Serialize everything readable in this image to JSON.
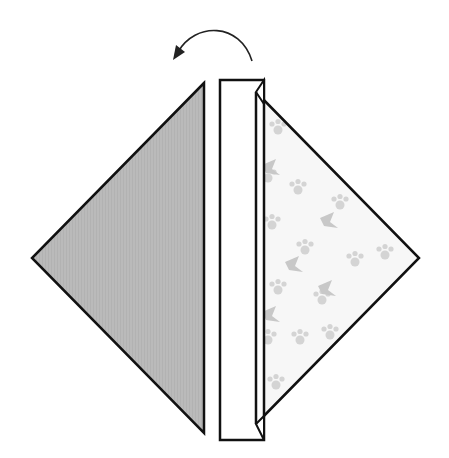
{
  "diagram": {
    "type": "origami-fold-step",
    "instruction": "Fold the right flap over to the left",
    "arrow": {
      "direction": "left",
      "icon": "curved-arrow-left-icon"
    },
    "colors": {
      "back_side": "#b9b9b9",
      "front_side": "#f6f6f6",
      "pattern": "#d6d6d6",
      "outline": "#111111"
    },
    "parts": [
      {
        "name": "left-gray-triangle",
        "label": "Colored side (back)"
      },
      {
        "name": "center-folded-strip",
        "label": "Folded strip"
      },
      {
        "name": "right-patterned-triangle",
        "label": "Patterned side (front)"
      }
    ]
  }
}
